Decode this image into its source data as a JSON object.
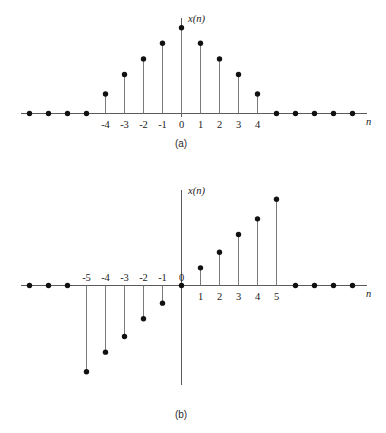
{
  "figure": {
    "background_color": "#ffffff",
    "axis_color": "#5a5a5a",
    "stem_color": "#7a7a7a",
    "marker_color": "#111111",
    "panels": [
      {
        "caption": "(a)"
      },
      {
        "caption": "(b)"
      }
    ]
  },
  "labels": {
    "signal_label": "x(n)",
    "axis_label_n": "n",
    "caption_a": "(a)",
    "caption_b": "(b)"
  },
  "chart_data": [
    {
      "type": "scatter",
      "subtype": "stem",
      "title": "(a)",
      "panel": "a",
      "symmetry": "even",
      "xlabel": "n",
      "ylabel": "x(n)",
      "grid": false,
      "legend": false,
      "xlim": [
        -12,
        12
      ],
      "ylim": [
        0,
        4.8
      ],
      "tick_labels": [
        "-4",
        "-3",
        "-2",
        "-1",
        "0",
        "1",
        "2",
        "3",
        "4"
      ],
      "tick_positions": [
        -4,
        -3,
        -2,
        -1,
        0,
        1,
        2,
        3,
        4
      ],
      "x": [
        -9,
        -8,
        -7,
        -6,
        -5,
        -4,
        -3,
        -2,
        -1,
        0,
        1,
        2,
        3,
        4,
        5,
        6,
        7,
        8,
        9,
        10
      ],
      "values": [
        0,
        0,
        0,
        0,
        0,
        1.0,
        2.0,
        2.8,
        3.6,
        4.4,
        3.6,
        2.8,
        2.0,
        1.0,
        0,
        0,
        0,
        0,
        0,
        0
      ],
      "note": "Even symmetric discrete-time sequence: x(-n) = x(n)"
    },
    {
      "type": "scatter",
      "subtype": "stem",
      "title": "(b)",
      "panel": "b",
      "symmetry": "odd",
      "xlabel": "n",
      "ylabel": "x(n)",
      "grid": false,
      "legend": false,
      "xlim": [
        -12,
        12
      ],
      "ylim": [
        -5.0,
        5.0
      ],
      "tick_labels": [
        "-5",
        "-4",
        "-3",
        "-2",
        "-1",
        "0",
        "1",
        "2",
        "3",
        "4",
        "5"
      ],
      "tick_positions": [
        -5,
        -4,
        -3,
        -2,
        -1,
        0,
        1,
        2,
        3,
        4,
        5
      ],
      "x": [
        -10,
        -9,
        -8,
        -7,
        -6,
        -5,
        -4,
        -3,
        -2,
        -1,
        0,
        1,
        2,
        3,
        4,
        5,
        6,
        7,
        8,
        9,
        10
      ],
      "values": [
        0,
        0,
        0,
        0,
        0,
        -4.4,
        -3.4,
        -2.6,
        -1.7,
        -0.9,
        0,
        0.9,
        1.7,
        2.6,
        3.4,
        4.4,
        0,
        0,
        0,
        0,
        0
      ],
      "note": "Odd antisymmetric discrete-time sequence: x(-n) = -x(n)"
    }
  ]
}
